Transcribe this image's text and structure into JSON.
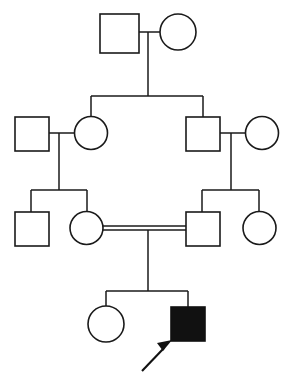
{
  "figure": {
    "type": "pedigree-chart",
    "title": "",
    "caption": "",
    "width": 293,
    "height": 377,
    "background_color": "#ffffff",
    "line_color": "#1a1a1a",
    "affected_fill_color": "#111111",
    "unaffected_fill_color": "#ffffff"
  },
  "legend": {
    "square_meaning": "male",
    "circle_meaning": "female",
    "filled_meaning": "affected",
    "open_meaning": "unaffected",
    "double_line_meaning": "consanguineous mating",
    "arrow_meaning": "proband"
  },
  "generations": [
    {
      "id": "I",
      "label": "",
      "individuals": [
        {
          "id": "I-1",
          "shape": "square",
          "sex": "male",
          "affected": false,
          "label": "",
          "cx": 119.5,
          "cy": 33.5,
          "size": 39
        },
        {
          "id": "I-2",
          "shape": "circle",
          "sex": "female",
          "affected": false,
          "label": "",
          "cx": 178,
          "cy": 32,
          "size": 36
        }
      ],
      "matings": [
        {
          "id": "mating-I",
          "partners": [
            "I-1",
            "I-2"
          ],
          "consanguineous": false,
          "line_y": 32,
          "x1": 139,
          "x2": 160,
          "descent_x": 148,
          "descent_y_end": 96,
          "children": [
            "II-2",
            "II-3"
          ]
        }
      ]
    },
    {
      "id": "II",
      "label": "",
      "individuals": [
        {
          "id": "II-1",
          "shape": "square",
          "sex": "male",
          "affected": false,
          "label": "",
          "cx": 31.5,
          "cy": 133.5,
          "size": 34
        },
        {
          "id": "II-2",
          "shape": "circle",
          "sex": "female",
          "affected": false,
          "label": "",
          "cx": 91,
          "cy": 133,
          "size": 33
        },
        {
          "id": "II-3",
          "shape": "square",
          "sex": "male",
          "affected": false,
          "label": "",
          "cx": 202.5,
          "cy": 133.5,
          "size": 34
        },
        {
          "id": "II-4",
          "shape": "circle",
          "sex": "female",
          "affected": false,
          "label": "",
          "cx": 262,
          "cy": 133,
          "size": 33
        }
      ],
      "sibship_bar": {
        "y": 96,
        "x1": 91,
        "x2": 203,
        "drop_ys": [
          116,
          116
        ]
      },
      "matings": [
        {
          "id": "mating-II-left",
          "partners": [
            "II-1",
            "II-2"
          ],
          "consanguineous": false,
          "line_y": 133,
          "x1": 48.5,
          "x2": 74.5,
          "descent_x": 59,
          "descent_y_end": 190,
          "children": [
            "III-1",
            "III-2"
          ]
        },
        {
          "id": "mating-II-right",
          "partners": [
            "II-3",
            "II-4"
          ],
          "consanguineous": false,
          "line_y": 133,
          "x1": 219.5,
          "x2": 245.5,
          "descent_x": 231,
          "descent_y_end": 190,
          "children": [
            "III-3",
            "III-4"
          ]
        }
      ]
    },
    {
      "id": "III",
      "label": "",
      "individuals": [
        {
          "id": "III-1",
          "shape": "square",
          "sex": "male",
          "affected": false,
          "label": "",
          "cx": 31.5,
          "cy": 228.5,
          "size": 34
        },
        {
          "id": "III-2",
          "shape": "circle",
          "sex": "female",
          "affected": false,
          "label": "",
          "cx": 86.5,
          "cy": 228,
          "size": 33
        },
        {
          "id": "III-3",
          "shape": "square",
          "sex": "male",
          "affected": false,
          "label": "",
          "cx": 202.5,
          "cy": 228.5,
          "size": 34
        },
        {
          "id": "III-4",
          "shape": "circle",
          "sex": "female",
          "affected": false,
          "label": "",
          "cx": 259.5,
          "cy": 228,
          "size": 33
        }
      ],
      "sibship_bars": [
        {
          "id": "sibship-III-left",
          "y": 190,
          "x1": 31,
          "x2": 87,
          "parent_drop_x": 59
        },
        {
          "id": "sibship-III-right",
          "y": 190,
          "x1": 202,
          "x2": 259,
          "parent_drop_x": 231
        }
      ],
      "matings": [
        {
          "id": "mating-III-consanguineous",
          "partners": [
            "III-2",
            "III-3"
          ],
          "consanguineous": true,
          "line_y": 228,
          "line_y_offsets": [
            -2,
            2
          ],
          "x1": 103,
          "x2": 186,
          "descent_x": 148,
          "descent_y_end": 291,
          "children": [
            "IV-1",
            "IV-2"
          ]
        }
      ]
    },
    {
      "id": "IV",
      "label": "",
      "individuals": [
        {
          "id": "IV-1",
          "shape": "circle",
          "sex": "female",
          "affected": false,
          "label": "",
          "cx": 106,
          "cy": 324,
          "size": 36
        },
        {
          "id": "IV-2",
          "shape": "square",
          "sex": "male",
          "affected": true,
          "proband": true,
          "label": "",
          "cx": 188,
          "cy": 324,
          "size": 34
        }
      ],
      "sibship_bar": {
        "id": "sibship-IV",
        "y": 291,
        "x1": 106,
        "x2": 188,
        "parent_drop_x": 148
      }
    }
  ],
  "proband_marker": {
    "id": "proband-arrow",
    "points_to": "IV-2",
    "tail_x": 142,
    "tail_y": 371,
    "head_x": 171,
    "head_y": 342
  }
}
